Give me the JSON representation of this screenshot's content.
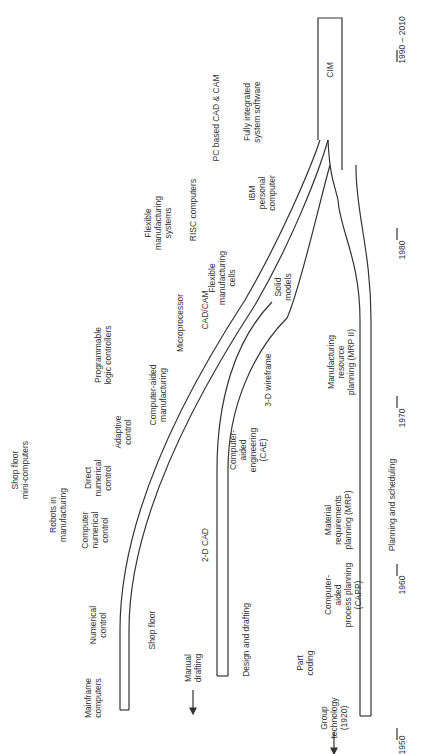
{
  "diagram": {
    "type": "timeline-flow",
    "orientation": "rotated-90-ccw",
    "line_color": "#333333",
    "text_color": "#333333",
    "axis": {
      "ticks": [
        {
          "label": "1950",
          "x": 397,
          "y": 722
        },
        {
          "label": "1960",
          "x": 397,
          "y": 558
        },
        {
          "label": "1970",
          "x": 397,
          "y": 390
        },
        {
          "label": "1980",
          "x": 397,
          "y": 222
        },
        {
          "label": "1990 – 2010",
          "x": 397,
          "y": 50
        }
      ]
    },
    "streams": [
      {
        "id": "shop-floor",
        "label": "Shop floor",
        "x": 152,
        "y": 630
      },
      {
        "id": "design-drafting",
        "label": "Design and drafting",
        "x": 246,
        "y": 640
      },
      {
        "id": "planning-scheduling",
        "label": "Planning and scheduling",
        "x": 392,
        "y": 490
      }
    ],
    "merged": {
      "label": "CIM",
      "x": 387,
      "y": 70
    },
    "origins": [
      {
        "label": "Manual\ndrafting",
        "x": 193,
        "y": 652
      },
      {
        "label": "Group\ntechnology\n(1920)",
        "x": 334,
        "y": 718
      }
    ],
    "milestones": [
      {
        "label": "Mainframe\ncomputers",
        "x": 93,
        "y": 698
      },
      {
        "label": "Numerical\ncontrol",
        "x": 98,
        "y": 625
      },
      {
        "label": "Computer\nnumerical\ncontrol",
        "x": 95,
        "y": 530
      },
      {
        "label": "Robots in\nmanufacturing",
        "x": 58,
        "y": 515
      },
      {
        "label": "Direct\nnumerical\ncontrol",
        "x": 98,
        "y": 478
      },
      {
        "label": "Shop floor\nmini-computers",
        "x": 20,
        "y": 480
      },
      {
        "label": "Adaptive\ncontrol",
        "x": 123,
        "y": 432
      },
      {
        "label": "Computer-aided\nmanufacturing",
        "x": 158,
        "y": 402
      },
      {
        "label": "Programmable\nlogic controllers",
        "x": 103,
        "y": 360
      },
      {
        "label": "Microprocessor",
        "x": 180,
        "y": 323
      },
      {
        "label": "CAD/CAM",
        "x": 205,
        "y": 310
      },
      {
        "label": "Flexible\nmanufacturing\ncells",
        "x": 220,
        "y": 278
      },
      {
        "label": "Solid\nmodels",
        "x": 283,
        "y": 287
      },
      {
        "label": "Flexible\nmanufacturing\nsystems",
        "x": 158,
        "y": 223
      },
      {
        "label": "RISC computers",
        "x": 193,
        "y": 210
      },
      {
        "label": "IBM\npersonal\ncomputer",
        "x": 262,
        "y": 193
      },
      {
        "label": "PC based CAD & CAM",
        "x": 216,
        "y": 118
      },
      {
        "label": "Fully integrated\nsystem software",
        "x": 252,
        "y": 112
      },
      {
        "label": "2-D CAD",
        "x": 205,
        "y": 545
      },
      {
        "label": "3-D wireframe",
        "x": 268,
        "y": 380
      },
      {
        "label": "Computer-\naided\nengineering\n(CAE)",
        "x": 248,
        "y": 460
      },
      {
        "label": "Computer-\naided\nprocess planning\n(CAPP)",
        "x": 343,
        "y": 595
      },
      {
        "label": "Part\ncoding",
        "x": 305,
        "y": 665
      },
      {
        "label": "Material\nrequirements\nplanning (MRP)",
        "x": 338,
        "y": 520
      },
      {
        "label": "Manufacturing\nresource\nplanning (MRP II)",
        "x": 341,
        "y": 362
      }
    ]
  }
}
